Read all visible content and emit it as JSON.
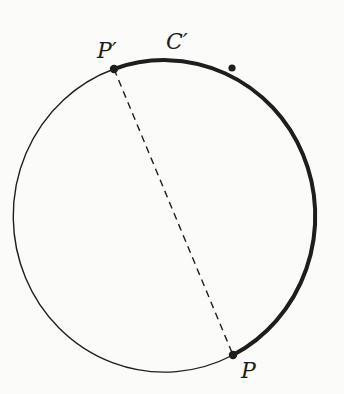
{
  "diagram": {
    "type": "geometric-figure",
    "colors": {
      "stroke": "#1e1e1e",
      "background": "#fbfbf9"
    },
    "circle": {
      "cx": 173,
      "cy": 212,
      "rx": 151,
      "ry": 156
    },
    "points": [
      {
        "id": "P_prime",
        "label": "P′",
        "x": 114,
        "y": 69
      },
      {
        "id": "M",
        "label": "",
        "x": 232,
        "y": 68
      },
      {
        "id": "P",
        "label": "P",
        "x": 233,
        "y": 355
      }
    ],
    "arcs": [
      {
        "id": "thick-arc",
        "label": "C′",
        "from": "P_prime",
        "to": "P",
        "style": "thick",
        "direction": "clockwise"
      },
      {
        "id": "thin-arc",
        "label": "",
        "from": "P",
        "to": "P_prime",
        "style": "thin",
        "direction": "clockwise"
      }
    ],
    "chord": {
      "from": "P_prime",
      "to": "P",
      "style": "dashed"
    }
  },
  "labels": {
    "p_prime": "P′",
    "c_prime": "C′",
    "p": "P"
  }
}
